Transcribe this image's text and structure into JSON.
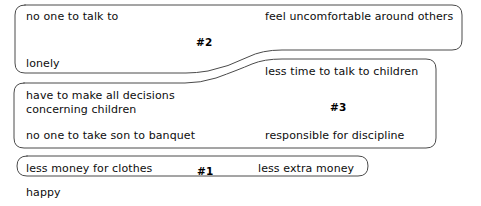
{
  "diagram": {
    "type": "affinity-grouping-diagram",
    "canvas": {
      "width": 481,
      "height": 206,
      "background": "#ffffff"
    },
    "stroke_color": "#4a4a4a",
    "text_color": "#0d0d0d",
    "groups": [
      {
        "id": "group-2",
        "number_label": "#2",
        "number_x": 196,
        "number_y": 36,
        "items": [
          {
            "text": "no one to talk to",
            "x": 26,
            "y": 10
          },
          {
            "text": "feel uncomfortable around others",
            "x": 265,
            "y": 10
          },
          {
            "text": "lonely",
            "x": 26,
            "y": 57
          }
        ]
      },
      {
        "id": "group-3",
        "number_label": "#3",
        "number_x": 330,
        "number_y": 101,
        "items": [
          {
            "text": "less time to talk to children",
            "x": 265,
            "y": 65
          },
          {
            "text": "have to make all decisions",
            "x": 26,
            "y": 89
          },
          {
            "text": "concerning children",
            "x": 26,
            "y": 103
          },
          {
            "text": "no one to take son to banquet",
            "x": 26,
            "y": 129
          },
          {
            "text": "responsible for discipline",
            "x": 265,
            "y": 129
          }
        ]
      },
      {
        "id": "group-1",
        "number_label": "#1",
        "number_x": 197,
        "number_y": 165,
        "items": [
          {
            "text": "less money for clothes",
            "x": 26,
            "y": 162
          },
          {
            "text": "less extra money",
            "x": 258,
            "y": 162
          }
        ]
      }
    ],
    "ungrouped_items": [
      {
        "text": "happy",
        "x": 26,
        "y": 186
      }
    ],
    "outline_paths": {
      "group_2": "M 25 5 L 452 5 Q 462 5 462 15 L 462 40 Q 462 50 452 50 L 282 50 Q 262 50 248 57 Q 228 67 208 71 Q 196 73 186 73 L 25 73 Q 15 73 15 63 L 15 15 Q 15 5 25 5 Z",
      "group_3": "M 24 83 L 185 83 Q 200 83 216 78 Q 238 70 252 64 Q 264 59 282 59 L 426 59 Q 436 59 436 69 L 436 138 Q 436 148 426 148 L 24 148 Q 14 148 14 138 L 14 93 Q 14 83 24 83 Z",
      "group_1": "M 27 156 L 358 156 Q 368 156 368 166 Q 368 176 358 176 L 27 176 Q 17 176 17 166 Q 17 156 27 156 Z"
    }
  }
}
